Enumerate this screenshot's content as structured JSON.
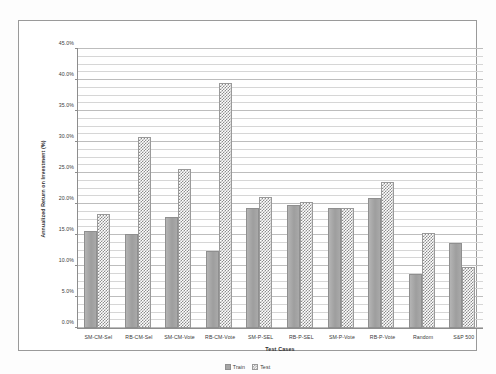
{
  "chart_data": {
    "type": "bar",
    "title": "",
    "xlabel": "Test Cases",
    "ylabel": "Annualized Return on Investment (%)",
    "ylim": [
      0,
      45
    ],
    "ytick_step": 5,
    "minor_gridlines": true,
    "grid": true,
    "legend_position": "bottom",
    "value_suffix": "%",
    "categories": [
      "SM-CM-Sel",
      "RB-CM-Sel",
      "SM-CM-Vote",
      "RB-CM-Vote",
      "SM-P-SEL",
      "RB-P-SEL",
      "SM-P-Vote",
      "RB-P-Vote",
      "Random",
      "S&P 500"
    ],
    "ytick_labels": [
      "0.0%",
      "5.0%",
      "10.0%",
      "15.0%",
      "20.0%",
      "25.0%",
      "30.0%",
      "35.0%",
      "40.0%",
      "45.0%"
    ],
    "ytick_values": [
      0,
      5,
      10,
      15,
      20,
      25,
      30,
      35,
      40,
      45
    ],
    "series": [
      {
        "name": "Train",
        "color": "#a6a6a6",
        "pattern": "solid",
        "values": [
          15.2,
          14.8,
          17.5,
          12.0,
          19.0,
          19.4,
          19.0,
          20.6,
          8.4,
          13.4
        ]
      },
      {
        "name": "Test",
        "color": "#8c8c8c",
        "pattern": "checkered",
        "values": [
          18.0,
          30.3,
          25.3,
          39.1,
          20.7,
          20.0,
          19.0,
          23.2,
          15.0,
          9.5
        ]
      }
    ]
  }
}
